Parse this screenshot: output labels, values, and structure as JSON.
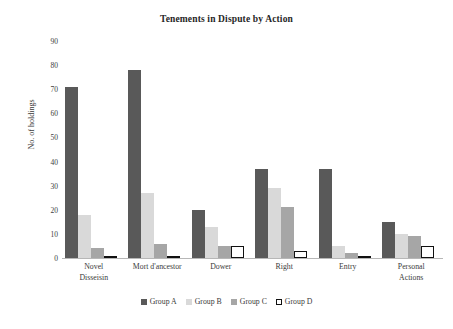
{
  "chart_data": {
    "type": "bar",
    "title": "Tenements in Dispute by Action",
    "xlabel": "",
    "ylabel": "No. of holdings",
    "ylim": [
      0,
      90
    ],
    "ytick_step": 10,
    "yticks": [
      "90",
      "80",
      "70",
      "60",
      "50",
      "40",
      "30",
      "20",
      "10",
      "0"
    ],
    "grid": false,
    "legend_position": "bottom",
    "categories": [
      "Novel Disseisin",
      "Mort d'ancestor",
      "Dower",
      "Right",
      "Entry",
      "Personal Actions"
    ],
    "category_lines": [
      [
        "Novel",
        "Disseisin"
      ],
      [
        "Mort d'ancestor"
      ],
      [
        "Dower"
      ],
      [
        "Right"
      ],
      [
        "Entry"
      ],
      [
        "Personal",
        "Actions"
      ]
    ],
    "series": [
      {
        "name": "Group A",
        "color": "#595959",
        "values": [
          71,
          78,
          20,
          37,
          37,
          15
        ]
      },
      {
        "name": "Group B",
        "color": "#d9d9d9",
        "values": [
          18,
          27,
          13,
          29,
          5,
          10
        ]
      },
      {
        "name": "Group C",
        "color": "#a6a6a6",
        "values": [
          4,
          6,
          5,
          21,
          2,
          9
        ]
      },
      {
        "name": "Group D",
        "color": "#ffffff",
        "values": [
          1,
          0,
          5,
          3,
          0,
          5
        ]
      }
    ]
  }
}
